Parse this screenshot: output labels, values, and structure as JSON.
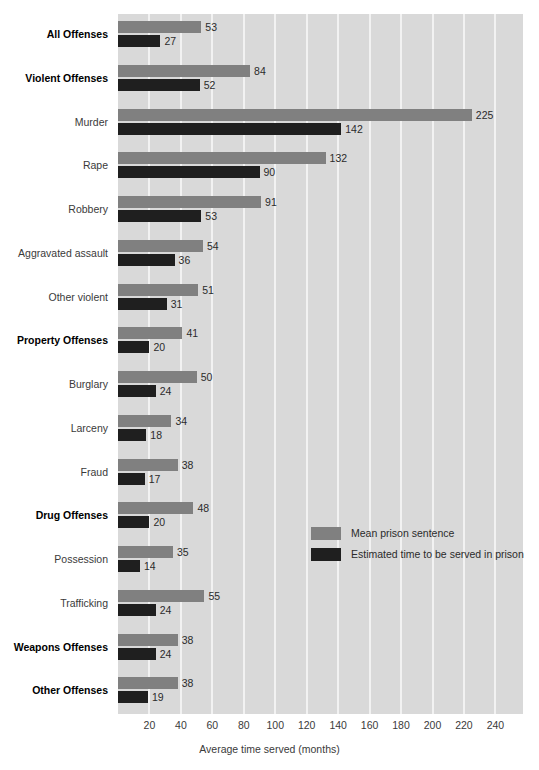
{
  "chart_data": {
    "type": "bar",
    "orientation": "horizontal",
    "title": "",
    "xlabel": "Average time served (months)",
    "ylabel": "",
    "xlim": [
      0,
      258
    ],
    "xticks": [
      20,
      40,
      60,
      80,
      100,
      120,
      140,
      160,
      180,
      200,
      220,
      240
    ],
    "grid": "vertical-white-gridlines",
    "legend_position": "inside-middle-right",
    "categories": [
      "All Offenses",
      "Violent Offenses",
      "Murder",
      "Rape",
      "Robbery",
      "Aggravated assault",
      "Other violent",
      "Property Offenses",
      "Burglary",
      "Larceny",
      "Fraud",
      "Drug Offenses",
      "Possession",
      "Trafficking",
      "Weapons Offenses",
      "Other Offenses"
    ],
    "category_emphasis": [
      true,
      true,
      false,
      false,
      false,
      false,
      false,
      true,
      false,
      false,
      false,
      true,
      false,
      false,
      true,
      true
    ],
    "series": [
      {
        "name": "Mean prison sentence",
        "color": "#808080",
        "values": [
          53,
          84,
          225,
          132,
          91,
          54,
          51,
          41,
          50,
          34,
          38,
          48,
          35,
          55,
          38,
          38
        ]
      },
      {
        "name": "Estimated time to be served in prison",
        "color": "#1f1f1f",
        "values": [
          27,
          52,
          142,
          90,
          53,
          36,
          31,
          20,
          24,
          18,
          17,
          20,
          14,
          24,
          24,
          19
        ]
      }
    ]
  },
  "legend": {
    "items": [
      {
        "label": "Mean prison sentence",
        "swatch": "mean"
      },
      {
        "label": "Estimated time to be served in prison",
        "swatch": "serv"
      }
    ]
  },
  "axis": {
    "xlabel": "Average time served (months)"
  },
  "ghost_title": ""
}
